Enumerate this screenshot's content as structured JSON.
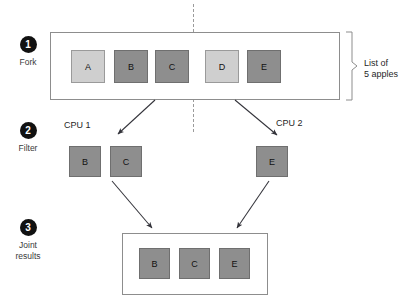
{
  "diagram": {
    "steps": [
      {
        "number": "1",
        "caption": "Fork"
      },
      {
        "number": "2",
        "caption": "Filter"
      },
      {
        "number": "3",
        "caption": "Joint\nresults"
      }
    ],
    "step_labels": {
      "fork": "Fork",
      "filter": "Filter",
      "joint_line1": "Joint",
      "joint_line2": "results"
    },
    "step_numbers": {
      "one": "1",
      "two": "2",
      "three": "3"
    },
    "bracket_label": {
      "line1": "List of",
      "line2": "5 apples"
    },
    "cpu_labels": {
      "cpu1": "CPU 1",
      "cpu2": "CPU 2"
    },
    "fork_row": [
      {
        "label": "A",
        "shade": "light"
      },
      {
        "label": "B",
        "shade": "dark"
      },
      {
        "label": "C",
        "shade": "dark"
      },
      {
        "label": "D",
        "shade": "light"
      },
      {
        "label": "E",
        "shade": "dark"
      }
    ],
    "filter_cpu1": [
      {
        "label": "B",
        "shade": "dark"
      },
      {
        "label": "C",
        "shade": "dark"
      }
    ],
    "filter_cpu2": [
      {
        "label": "E",
        "shade": "dark"
      }
    ],
    "joint_row": [
      {
        "label": "B",
        "shade": "dark"
      },
      {
        "label": "C",
        "shade": "dark"
      },
      {
        "label": "E",
        "shade": "dark"
      }
    ],
    "colors": {
      "light_square": "#cfcfcf",
      "dark_square": "#8e8e8e",
      "panel_border": "#8d8d8d",
      "bullet": "#111111",
      "arrow": "#33333a",
      "divider": "#9b9b9b",
      "background": "#ffffff"
    }
  }
}
